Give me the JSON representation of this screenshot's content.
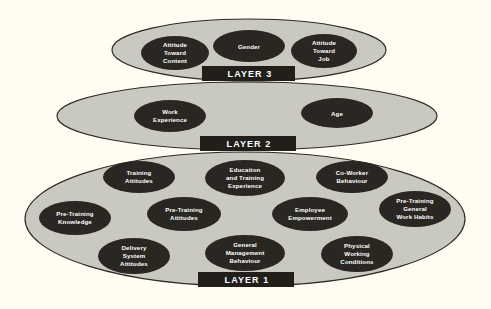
{
  "diagram": {
    "type": "layered-ellipse-diagram",
    "background_color": "#fffdf2",
    "layer_fill_color": "#c9c9c2",
    "layer_stroke_color": "#2b2a26",
    "node_fill_color": "#2a2722",
    "node_text_color": "#ffffff",
    "layer_box_fill_color": "#221f1b",
    "layers": [
      {
        "id": "layer-3",
        "label": "LAYER 3",
        "order": 3,
        "nodes": [
          {
            "id": "attitude-toward-content",
            "lines": [
              "Attitude",
              "Toward",
              "Content"
            ]
          },
          {
            "id": "gender",
            "lines": [
              "Gender"
            ]
          },
          {
            "id": "attitude-toward-job",
            "lines": [
              "Attitude",
              "Toward",
              "Job"
            ]
          }
        ]
      },
      {
        "id": "layer-2",
        "label": "LAYER 2",
        "order": 2,
        "nodes": [
          {
            "id": "work-experience",
            "lines": [
              "Work",
              "Experience"
            ]
          },
          {
            "id": "age",
            "lines": [
              "Age"
            ]
          }
        ]
      },
      {
        "id": "layer-1",
        "label": "LAYER 1",
        "order": 1,
        "nodes": [
          {
            "id": "training-attitudes",
            "lines": [
              "Training",
              "Attitudes"
            ]
          },
          {
            "id": "education-and-training-experience",
            "lines": [
              "Education",
              "and Training",
              "Experience"
            ]
          },
          {
            "id": "co-worker-behaviour",
            "lines": [
              "Co-Worker",
              "Behaviour"
            ]
          },
          {
            "id": "pre-training-knowledge",
            "lines": [
              "Pre-Training",
              "Knowledge"
            ]
          },
          {
            "id": "pre-training-attitudes",
            "lines": [
              "Pre-Training",
              "Attitudes"
            ]
          },
          {
            "id": "employee-empowerment",
            "lines": [
              "Employee",
              "Empowerment"
            ]
          },
          {
            "id": "pre-training-general-work-habits",
            "lines": [
              "Pre-Training",
              "General",
              "Work Habits"
            ]
          },
          {
            "id": "delivery-system-attitudes",
            "lines": [
              "Delivery",
              "System",
              "Attitudes"
            ]
          },
          {
            "id": "general-management-behaviour",
            "lines": [
              "General",
              "Management",
              "Behaviour"
            ]
          },
          {
            "id": "physical-working-conditions",
            "lines": [
              "Physical",
              "Working",
              "Conditions"
            ]
          }
        ]
      }
    ],
    "text": {
      "layer3_label": "LAYER 3",
      "layer2_label": "LAYER 2",
      "layer1_label": "LAYER 1",
      "attitude_toward_content_l1": "Attitude",
      "attitude_toward_content_l2": "Toward",
      "attitude_toward_content_l3": "Content",
      "gender_l1": "Gender",
      "attitude_toward_job_l1": "Attitude",
      "attitude_toward_job_l2": "Toward",
      "attitude_toward_job_l3": "Job",
      "work_experience_l1": "Work",
      "work_experience_l2": "Experience",
      "age_l1": "Age",
      "training_attitudes_l1": "Training",
      "training_attitudes_l2": "Attitudes",
      "education_training_l1": "Education",
      "education_training_l2": "and Training",
      "education_training_l3": "Experience",
      "co_worker_l1": "Co-Worker",
      "co_worker_l2": "Behaviour",
      "pre_training_knowledge_l1": "Pre-Training",
      "pre_training_knowledge_l2": "Knowledge",
      "pre_training_attitudes_l1": "Pre-Training",
      "pre_training_attitudes_l2": "Attitudes",
      "employee_empowerment_l1": "Employee",
      "employee_empowerment_l2": "Empowerment",
      "pre_training_habits_l1": "Pre-Training",
      "pre_training_habits_l2": "General",
      "pre_training_habits_l3": "Work Habits",
      "delivery_system_l1": "Delivery",
      "delivery_system_l2": "System",
      "delivery_system_l3": "Attitudes",
      "general_management_l1": "General",
      "general_management_l2": "Management",
      "general_management_l3": "Behaviour",
      "physical_working_l1": "Physical",
      "physical_working_l2": "Working",
      "physical_working_l3": "Conditions"
    }
  }
}
